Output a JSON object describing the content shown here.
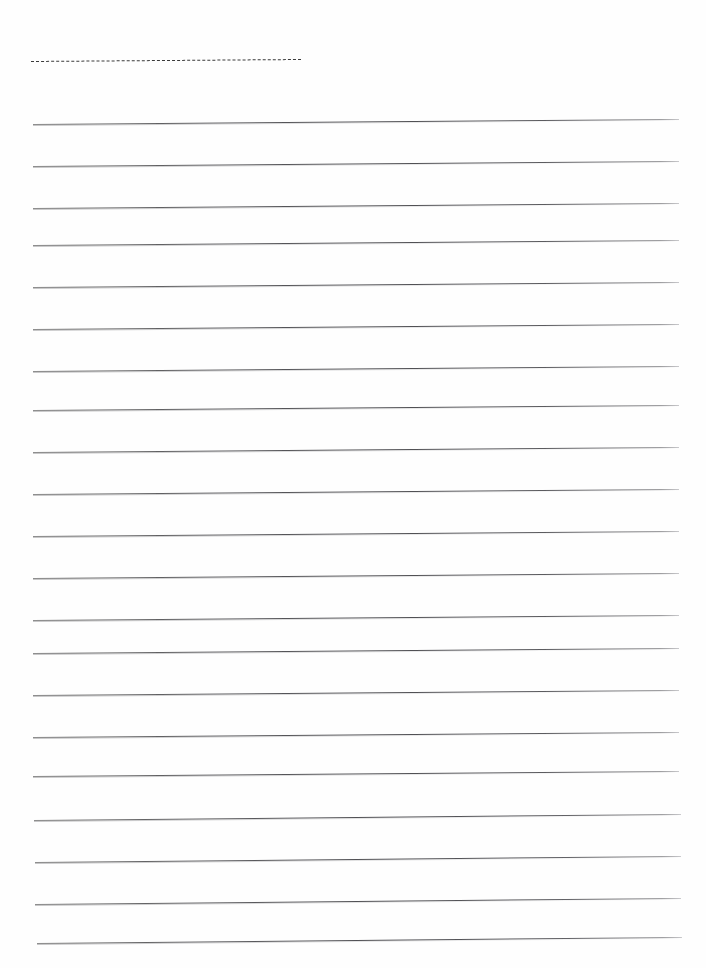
{
  "document": {
    "kind": "scanned-blank-ruled-page",
    "page_width": 706,
    "page_height": 968,
    "background_color": "#ffffff",
    "paper_color": "#fefefe",
    "text_content": "",
    "visible_text": []
  },
  "header_rule": {
    "style": "dashed",
    "color": "#3a3a3a",
    "x_start": 31,
    "x_end": 301,
    "y_start": 61,
    "y_end": 59,
    "thickness": 1.3
  },
  "ruling": {
    "style": "solid",
    "color": "#4e4e52",
    "line_count": 20,
    "spacing": 42,
    "thickness": 1.15,
    "x_start": 33,
    "x_end": 679,
    "skew_rise": 5,
    "lines": [
      {
        "index": 1,
        "x_start": 33,
        "x_end": 679,
        "y_left": 124,
        "y_right": 119
      },
      {
        "index": 2,
        "x_start": 33,
        "x_end": 679,
        "y_left": 166,
        "y_right": 161
      },
      {
        "index": 3,
        "x_start": 33,
        "x_end": 679,
        "y_left": 208,
        "y_right": 203
      },
      {
        "index": 4,
        "x_start": 33,
        "x_end": 679,
        "y_left": 245,
        "y_right": 240
      },
      {
        "index": 5,
        "x_start": 33,
        "x_end": 679,
        "y_left": 287,
        "y_right": 282
      },
      {
        "index": 6,
        "x_start": 33,
        "x_end": 679,
        "y_left": 329,
        "y_right": 324
      },
      {
        "index": 7,
        "x_start": 33,
        "x_end": 679,
        "y_left": 371,
        "y_right": 366
      },
      {
        "index": 8,
        "x_start": 33,
        "x_end": 679,
        "y_left": 410,
        "y_right": 405
      },
      {
        "index": 9,
        "x_start": 33,
        "x_end": 679,
        "y_left": 452,
        "y_right": 447
      },
      {
        "index": 10,
        "x_start": 33,
        "x_end": 679,
        "y_left": 494,
        "y_right": 489
      },
      {
        "index": 11,
        "x_start": 33,
        "x_end": 679,
        "y_left": 536,
        "y_right": 531
      },
      {
        "index": 12,
        "x_start": 33,
        "x_end": 679,
        "y_left": 578,
        "y_right": 573
      },
      {
        "index": 13,
        "x_start": 33,
        "x_end": 679,
        "y_left": 620,
        "y_right": 615
      },
      {
        "index": 14,
        "x_start": 33,
        "x_end": 679,
        "y_left": 653,
        "y_right": 648
      },
      {
        "index": 15,
        "x_start": 33,
        "x_end": 679,
        "y_left": 695,
        "y_right": 690
      },
      {
        "index": 16,
        "x_start": 33,
        "x_end": 679,
        "y_left": 737,
        "y_right": 732
      },
      {
        "index": 17,
        "x_start": 33,
        "x_end": 679,
        "y_left": 776,
        "y_right": 771
      },
      {
        "index": 18,
        "x_start": 34,
        "x_end": 681,
        "y_left": 820,
        "y_right": 814
      },
      {
        "index": 19,
        "x_start": 35,
        "x_end": 681,
        "y_left": 862,
        "y_right": 856
      },
      {
        "index": 20,
        "x_start": 35,
        "x_end": 681,
        "y_left": 904,
        "y_right": 898
      },
      {
        "index": 21,
        "x_start": 37,
        "x_end": 682,
        "y_left": 943,
        "y_right": 937
      }
    ]
  }
}
